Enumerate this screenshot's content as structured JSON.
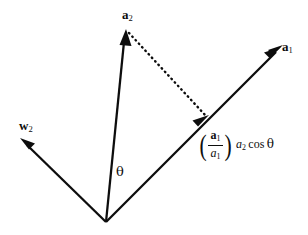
{
  "figure": {
    "type": "vector-projection-diagram",
    "background_color": "#ffffff",
    "stroke_color": "#0d0d0d",
    "width": 308,
    "height": 235,
    "origin": {
      "x": 106,
      "y": 222
    },
    "vectors": [
      {
        "name": "a1",
        "label_text": "a",
        "label_subscript": "1",
        "style": "bold-vector",
        "from": {
          "x": 106,
          "y": 222
        },
        "to": {
          "x": 281,
          "y": 47
        },
        "stroke_width": 2.2,
        "arrowhead": true
      },
      {
        "name": "a2",
        "label_text": "a",
        "label_subscript": "2",
        "style": "bold-vector",
        "from": {
          "x": 106,
          "y": 222
        },
        "to": {
          "x": 126,
          "y": 30
        },
        "stroke_width": 2.2,
        "arrowhead": true
      },
      {
        "name": "w2",
        "label_text": "w",
        "label_subscript": "2",
        "style": "bold-vector",
        "from": {
          "x": 106,
          "y": 222
        },
        "to": {
          "x": 21,
          "y": 139
        },
        "stroke_width": 2.2,
        "arrowhead": true
      }
    ],
    "projection_marker": {
      "name": "projection-point",
      "x": 206,
      "y": 122,
      "arrowhead": true,
      "description": "arrowhead on a1 marking the projection of a2 onto a1"
    },
    "dotted_line": {
      "name": "perpendicular-dotted-line",
      "from": {
        "x": 128,
        "y": 32
      },
      "to": {
        "x": 207,
        "y": 117
      },
      "dash_pattern": "1.2 4",
      "stroke_width": 2.4
    },
    "angle_label": {
      "name": "theta",
      "text": "θ",
      "x": 116,
      "y": 165
    },
    "projection_expression": {
      "numerator_vector": "a",
      "numerator_subscript": "1",
      "denominator_scalar": "a",
      "denominator_subscript": "1",
      "factor_scalar": "a",
      "factor_subscript": "2",
      "cos_text": "cos",
      "angle_text": "θ",
      "paren_open": "(",
      "paren_close": ")"
    }
  }
}
